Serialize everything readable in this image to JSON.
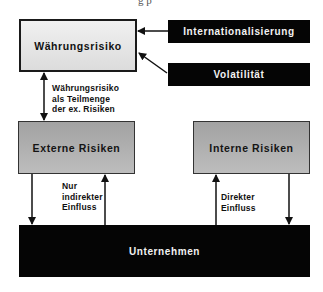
{
  "diagram": {
    "top_cut_text": "g p",
    "nodes": {
      "waehrungsrisiko": "Währungsrisiko",
      "internationalisierung": "Internationalisierung",
      "volatilitaet": "Volatilität",
      "externe_risiken": "Externe Risiken",
      "interne_risiken": "Interne Risiken",
      "unternehmen": "Unternehmen"
    },
    "edge_labels": {
      "teilmenge": [
        "Währungsrisiko",
        "als Teilmenge",
        "der ex. Risiken"
      ],
      "indirekt": [
        "Nur",
        "indirekter",
        "Einfluss"
      ],
      "direkt": [
        "Direkter",
        "Einfluss"
      ]
    },
    "colors": {
      "light_box": "#e6e6e6",
      "mid_box": "#afafaf",
      "dark_box": "#050505",
      "line": "#111111"
    }
  }
}
